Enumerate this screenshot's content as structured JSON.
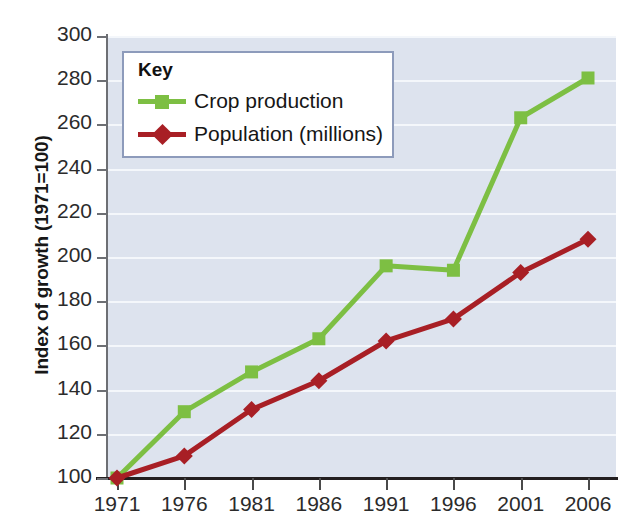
{
  "chart_data": {
    "type": "line",
    "title": "",
    "xlabel": "",
    "ylabel": "Index of growth (1971=100)",
    "categories": [
      "1971",
      "1976",
      "1981",
      "1986",
      "1991",
      "1996",
      "2001",
      "2006"
    ],
    "x": [
      1971,
      1976,
      1981,
      1986,
      1991,
      1996,
      2001,
      2006
    ],
    "ylim": [
      100,
      300
    ],
    "yticks": [
      100,
      120,
      140,
      160,
      180,
      200,
      220,
      240,
      260,
      280,
      300
    ],
    "grid": "horizontal",
    "legend_position": "top-left",
    "legend_title": "Key",
    "series": [
      {
        "name": "Crop production",
        "color": "#7dbf43",
        "marker": "square",
        "values": [
          100,
          130,
          148,
          163,
          196,
          194,
          263,
          281
        ]
      },
      {
        "name": "Population (millions)",
        "color": "#a81f25",
        "marker": "diamond",
        "values": [
          100,
          110,
          131,
          144,
          162,
          172,
          193,
          208
        ]
      }
    ]
  },
  "style": {
    "plot_background": "#dde3ee",
    "gridline_color": "#f4f7fb",
    "axis_color": "#231f20",
    "legend_border": "#8d9bbb",
    "legend_background": "#ffffff"
  }
}
